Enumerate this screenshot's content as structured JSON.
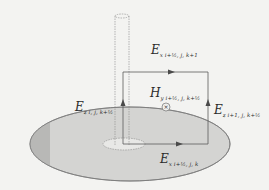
{
  "diagram": {
    "colors": {
      "background": "#f3f3f1",
      "disk_fill": "#d4d4d2",
      "disk_dark_fill": "#b8b8b6",
      "line": "#5a5a5a",
      "arrow": "#4a4a4a"
    },
    "labels": {
      "ex_top": {
        "main": "E",
        "sub": "x i+½, j, k+1"
      },
      "hy_center": {
        "main": "H",
        "sub": "y i+½, j, k+½"
      },
      "ez_right": {
        "main": "E",
        "sub": "z i+1, j, k+½"
      },
      "ez_left": {
        "main": "E",
        "sub": "z i, j, k+½"
      },
      "ex_bottom": {
        "main": "E",
        "sub": "x i+½, j, k"
      }
    },
    "hfield_symbol": "×"
  }
}
